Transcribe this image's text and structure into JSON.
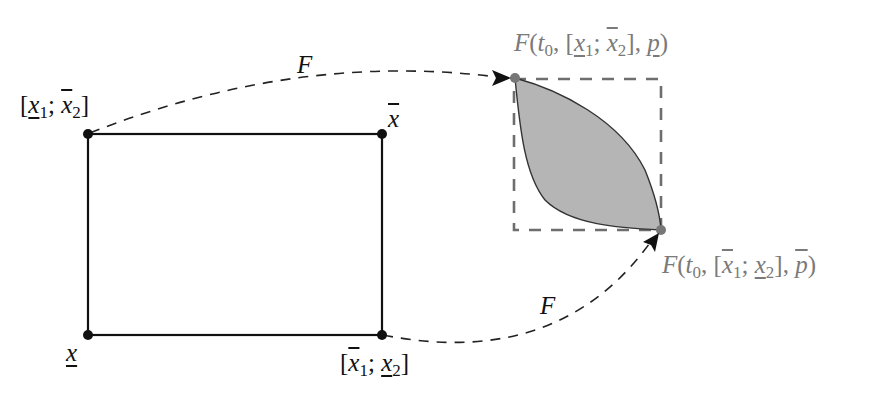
{
  "diagram": {
    "box": {
      "corners": {
        "top_left": {
          "label_prefix": "[",
          "var1": "x",
          "sub1": "1",
          "sep": "; ",
          "var2": "x",
          "sub2": "2",
          "label_suffix": "]",
          "var1_mark": "underline",
          "var2_mark": "overline"
        },
        "top_right": {
          "var": "x",
          "mark": "overline"
        },
        "bottom_left": {
          "var": "x",
          "mark": "underline"
        },
        "bottom_right": {
          "label_prefix": "[",
          "var1": "x",
          "sub1": "1",
          "sep": "; ",
          "var2": "x",
          "sub2": "2",
          "label_suffix": "]",
          "var1_mark": "overline",
          "var2_mark": "underline"
        }
      }
    },
    "arrows": {
      "top": {
        "label": "F"
      },
      "bottom": {
        "label": "F"
      }
    },
    "image_region": {
      "top_label": {
        "func": "F",
        "open": "(",
        "t": "t",
        "t_sub": "0",
        "comma": ", [",
        "var1": "x",
        "sub1": "1",
        "sep": "; ",
        "var2": "x",
        "sub2": "2",
        "close_bracket": "], ",
        "param": "p",
        "close": ")"
      },
      "bottom_label": {
        "func": "F",
        "open": "(",
        "t": "t",
        "t_sub": "0",
        "comma": ", [",
        "var1": "x",
        "sub1": "1",
        "sep": "; ",
        "var2": "x",
        "sub2": "2",
        "close_bracket": "], ",
        "param": "p",
        "close": ")"
      }
    },
    "colors": {
      "line": "#111111",
      "fill_region": "#b5b5b5",
      "dashed_box": "#6e6e6e",
      "label_gray": "#7a7a7a"
    }
  }
}
